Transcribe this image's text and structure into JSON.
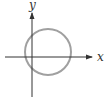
{
  "diagram": {
    "type": "coordinate-plane-circle",
    "axes": {
      "x_label": "x",
      "y_label": "y"
    },
    "circle": {
      "center_relative": "slightly right of and above origin",
      "stroke_color": "#a0a0a0"
    },
    "colors": {
      "axis": "#333333",
      "circle": "#a0a0a0"
    }
  }
}
